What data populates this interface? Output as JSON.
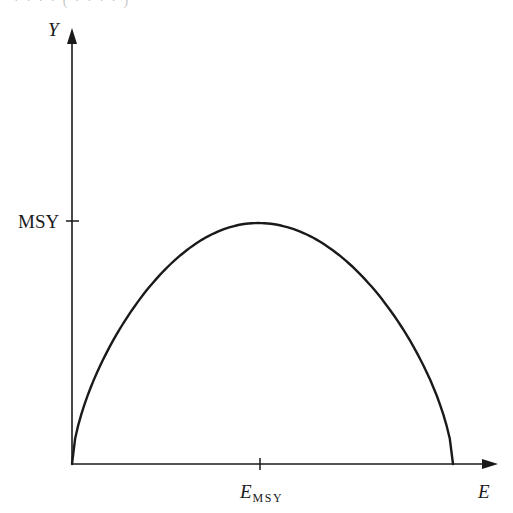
{
  "figure": {
    "top_residue_text": "· · · · ( · · · · )",
    "y_axis_label": "Y",
    "x_axis_label": "E",
    "y_tick_label": "MSY",
    "x_tick_label_main": "E",
    "x_tick_label_sub": "MSY"
  },
  "colors": {
    "ink": "#1a1a1a",
    "background": "#ffffff"
  },
  "chart_data": {
    "type": "line",
    "title": "",
    "xlabel": "E",
    "ylabel": "Y",
    "x_ticks": [
      {
        "label": "E_MSY",
        "value": 0.5
      }
    ],
    "y_ticks": [
      {
        "label": "MSY",
        "value": 1.0
      }
    ],
    "xlim": [
      0,
      1.07
    ],
    "ylim": [
      0,
      1.4
    ],
    "grid": false,
    "legend": null,
    "series": [
      {
        "name": "Yield",
        "x": [
          0,
          0.05,
          0.1,
          0.2,
          0.3,
          0.4,
          0.5,
          0.6,
          0.7,
          0.8,
          0.9,
          0.95,
          1.0
        ],
        "y": [
          0,
          0.19,
          0.36,
          0.64,
          0.84,
          0.96,
          1.0,
          0.96,
          0.84,
          0.64,
          0.36,
          0.19,
          0
        ]
      }
    ]
  }
}
